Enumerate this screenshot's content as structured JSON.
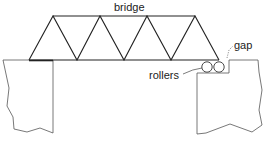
{
  "diagram": {
    "labels": {
      "bridge": "bridge",
      "gap": "gap",
      "rollers": "rollers"
    },
    "components": {
      "truss": {
        "type": "Warren truss",
        "top_chord_panels": 3,
        "triangles_up": 4
      },
      "left_support": "fixed pier",
      "right_support": "pier with rollers",
      "rollers_count": 2
    },
    "colors": {
      "line": "#222222",
      "pier": "#555555",
      "background": "#ffffff"
    }
  }
}
